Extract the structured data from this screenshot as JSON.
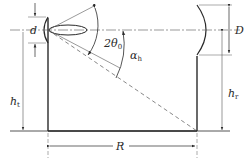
{
  "diagram": {
    "labels": {
      "d": {
        "main": "d",
        "sub": ""
      },
      "D": {
        "main": "D",
        "sub": ""
      },
      "beamwidth": {
        "main": "2θ",
        "sub": "0"
      },
      "alpha": {
        "main": "α",
        "sub": "h"
      },
      "ht_left": {
        "main": "h",
        "sub": "t"
      },
      "hr_right": {
        "main": "h",
        "sub": "r"
      },
      "R": {
        "main": "R",
        "sub": ""
      }
    },
    "elements": [
      "transmitting antenna (small dish, aperture d) on left tower",
      "receiving antenna (large dish, aperture D) on right tower",
      "main lobe of transmit beam",
      "beamwidth angle 2θ0",
      "depression angle αh to the base of receiving tower",
      "tower height ht, receiver height hr, separation R"
    ],
    "colors": {
      "line": "#2a2a2a",
      "dim": "#555555",
      "bg": "#ffffff"
    }
  }
}
